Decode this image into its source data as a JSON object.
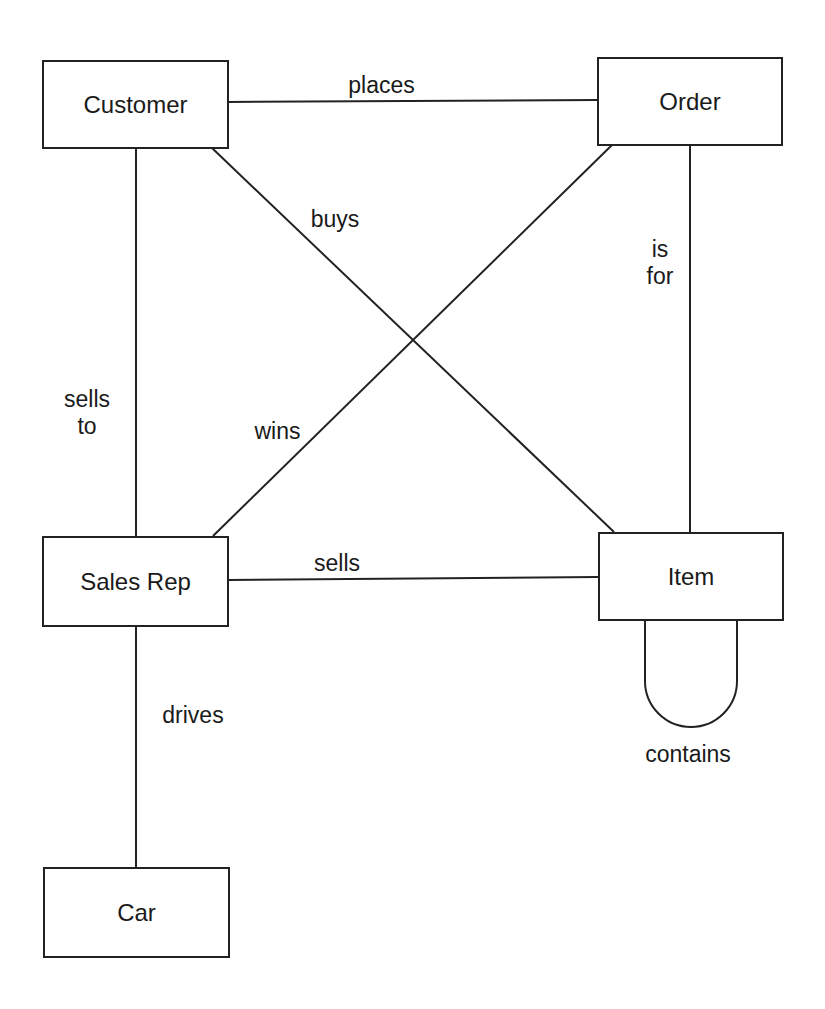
{
  "diagram": {
    "type": "entity-relationship",
    "entities": [
      {
        "id": "customer",
        "label": "Customer"
      },
      {
        "id": "order",
        "label": "Order"
      },
      {
        "id": "sales_rep",
        "label": "Sales Rep"
      },
      {
        "id": "item",
        "label": "Item"
      },
      {
        "id": "car",
        "label": "Car"
      }
    ],
    "relationships": [
      {
        "from": "customer",
        "to": "order",
        "label": "places"
      },
      {
        "from": "customer",
        "to": "item",
        "label": "buys"
      },
      {
        "from": "sales_rep",
        "to": "customer",
        "label_line1": "sells",
        "label_line2": "to"
      },
      {
        "from": "sales_rep",
        "to": "order",
        "label": "wins"
      },
      {
        "from": "order",
        "to": "item",
        "label_line1": "is",
        "label_line2": "for"
      },
      {
        "from": "sales_rep",
        "to": "item",
        "label": "sells"
      },
      {
        "from": "sales_rep",
        "to": "car",
        "label": "drives"
      },
      {
        "from": "item",
        "to": "item",
        "label": "contains"
      }
    ],
    "colors": {
      "line": "#222222",
      "background": "#ffffff"
    }
  }
}
